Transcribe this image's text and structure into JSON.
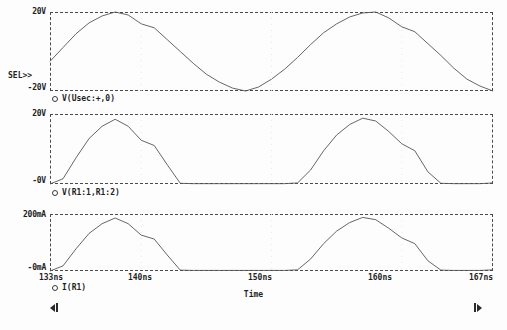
{
  "app": {
    "name": "pspice-probe-waveform-viewer",
    "background_color": "#ffffff",
    "trace_color": "#555555",
    "axis_color": "#4a4a4a"
  },
  "chart_data": [
    {
      "type": "line",
      "panel_name": "voltage-secondary",
      "title": "",
      "legend": "V(Usec:+,0)",
      "selected_marker": "SEL>>",
      "ylabel": "",
      "ytick_labels": [
        "20V",
        "-20V"
      ],
      "ylim": [
        -20,
        20
      ],
      "xlabel": "Time",
      "xlim": [
        133,
        167
      ],
      "xtick_labels": [
        "133ns",
        "140ns",
        "150ns",
        "160ns",
        "167ns"
      ],
      "xtick_values": [
        133,
        140,
        150,
        160,
        167
      ],
      "grid": false,
      "x": [
        133,
        134,
        135,
        136,
        137,
        138,
        139,
        140,
        141,
        142,
        143,
        144,
        145,
        146,
        147,
        148,
        149,
        150,
        151,
        152,
        153,
        154,
        155,
        156,
        157,
        158,
        159,
        160,
        161,
        162,
        163,
        164,
        165,
        166,
        167
      ],
      "values": [
        -5.0,
        2.0,
        9.0,
        14.5,
        18.0,
        20.0,
        18.5,
        14.0,
        12.0,
        6.0,
        0.0,
        -6.0,
        -11.5,
        -15.5,
        -18.5,
        -20.0,
        -18.0,
        -14.0,
        -9.0,
        -3.0,
        3.5,
        9.5,
        14.0,
        17.5,
        19.5,
        20.0,
        17.0,
        12.5,
        10.0,
        4.0,
        -2.0,
        -8.5,
        -14.0,
        -17.5,
        -20.0
      ]
    },
    {
      "type": "line",
      "panel_name": "voltage-r1",
      "title": "",
      "legend": "V(R1:1,R1:2)",
      "ylabel": "",
      "ytick_labels": [
        "20V",
        "-0V"
      ],
      "ylim": [
        0,
        20
      ],
      "xlabel": "",
      "xlim": [
        133,
        167
      ],
      "grid": false,
      "x": [
        133,
        134,
        135,
        136,
        137,
        138,
        139,
        140,
        141,
        142,
        143,
        144,
        145,
        146,
        147,
        148,
        149,
        150,
        151,
        152,
        153,
        154,
        155,
        156,
        157,
        158,
        159,
        160,
        161,
        162,
        163,
        164,
        165,
        166,
        167
      ],
      "values": [
        0.0,
        1.5,
        7.5,
        13.0,
        16.5,
        18.5,
        16.5,
        12.5,
        11.0,
        5.5,
        0.2,
        0.1,
        0.1,
        0.1,
        0.1,
        0.1,
        0.1,
        0.1,
        0.1,
        0.3,
        4.0,
        9.5,
        14.0,
        17.0,
        18.8,
        18.0,
        15.0,
        11.5,
        9.5,
        3.5,
        0.2,
        0.1,
        0.1,
        0.1,
        0.3
      ]
    },
    {
      "type": "line",
      "panel_name": "current-r1",
      "title": "",
      "legend": "I(R1)",
      "ylabel": "",
      "ytick_labels": [
        "200mA",
        "-0mA"
      ],
      "ylim": [
        0,
        200
      ],
      "xlabel": "Time",
      "xlim": [
        133,
        167
      ],
      "xtick_labels": [
        "133ns",
        "140ns",
        "150ns",
        "160ns",
        "167ns"
      ],
      "xtick_values": [
        133,
        140,
        150,
        160,
        167
      ],
      "grid": false,
      "x": [
        133,
        134,
        135,
        136,
        137,
        138,
        139,
        140,
        141,
        142,
        143,
        144,
        145,
        146,
        147,
        148,
        149,
        150,
        151,
        152,
        153,
        154,
        155,
        156,
        157,
        158,
        159,
        160,
        161,
        162,
        163,
        164,
        165,
        166,
        167
      ],
      "values": [
        0,
        18,
        78,
        132,
        166,
        186,
        166,
        126,
        112,
        56,
        3,
        2,
        2,
        2,
        2,
        2,
        2,
        2,
        2,
        4,
        42,
        96,
        140,
        170,
        188,
        180,
        150,
        116,
        96,
        36,
        3,
        2,
        2,
        2,
        4
      ]
    }
  ],
  "axis_title": "Time",
  "scroll": {
    "left_label": "◂",
    "right_label": "▸"
  }
}
